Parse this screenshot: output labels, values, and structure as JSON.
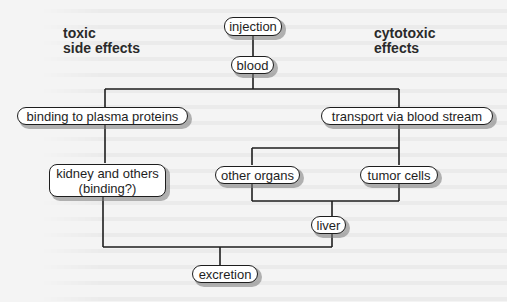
{
  "diagram": {
    "side_labels": {
      "left": "toxic\nside effects",
      "right": "cytotoxic\neffects"
    },
    "nodes": {
      "injection": "injection",
      "blood": "blood",
      "plasma": "binding to plasma proteins",
      "transport": "transport via blood stream",
      "kidney": "kidney and others\n(binding?)",
      "other_organs": "other organs",
      "tumor": "tumor cells",
      "liver": "liver",
      "excretion": "excretion"
    },
    "edges": [
      [
        "injection",
        "blood"
      ],
      [
        "blood",
        "binding to plasma proteins"
      ],
      [
        "blood",
        "transport via blood stream"
      ],
      [
        "binding to plasma proteins",
        "kidney and others (binding?)"
      ],
      [
        "transport via blood stream",
        "other organs"
      ],
      [
        "transport via blood stream",
        "tumor cells"
      ],
      [
        "other organs",
        "liver"
      ],
      [
        "tumor cells",
        "liver"
      ],
      [
        "kidney and others (binding?)",
        "excretion"
      ],
      [
        "liver",
        "excretion"
      ]
    ],
    "colors": {
      "line": "#1e1e1e",
      "box_fill": "#ffffff",
      "shadow": "#8a8a8a",
      "background": "#f4f4f4"
    }
  }
}
